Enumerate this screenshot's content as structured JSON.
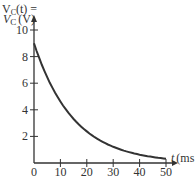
{
  "header_fragment": "V_C(t) = V_0 e^{-t/(R_T C)}",
  "chart_data": {
    "type": "line",
    "title": "",
    "xlabel": "t (ms)",
    "ylabel": "V_C (V)",
    "xlim": [
      0,
      50
    ],
    "ylim": [
      0,
      10
    ],
    "x_ticks": [
      "0",
      "10",
      "20",
      "30",
      "40",
      "50"
    ],
    "y_ticks": [
      "2",
      "4",
      "6",
      "8",
      "10"
    ],
    "grid": false,
    "series": [
      {
        "name": "V_C",
        "x": [
          0,
          5,
          10,
          15,
          20,
          25,
          30,
          35,
          40,
          45,
          50
        ],
        "y": [
          9.0,
          6.4,
          4.6,
          3.3,
          2.4,
          1.7,
          1.2,
          0.87,
          0.62,
          0.45,
          0.32
        ]
      }
    ]
  },
  "labels": {
    "y_axis": "V",
    "y_axis_sub": "C",
    "y_axis_unit": "(V)",
    "x_axis": "t",
    "x_axis_unit": "(ms"
  }
}
